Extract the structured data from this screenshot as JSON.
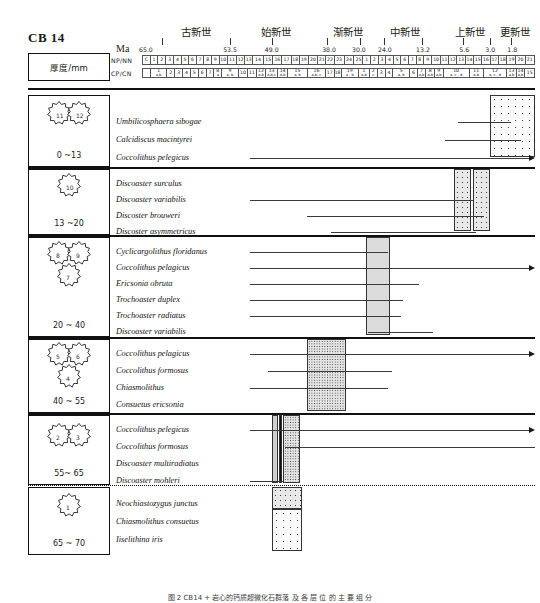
{
  "figure": {
    "sample_id": "CB 14",
    "ma_label": "Ma",
    "thickness_header": "厚度/mm",
    "caption": "图 2   CB14 + 岩心的钙质超微化石群落 及 各 层 位 的 主 要 组 分"
  },
  "timescale": {
    "epochs": [
      {
        "name": "古新世",
        "center_pct": 13.8
      },
      {
        "name": "始新世",
        "center_pct": 34.2
      },
      {
        "name": "渐新世",
        "center_pct": 52.3
      },
      {
        "name": "中新世",
        "center_pct": 66.9
      },
      {
        "name": "上新世",
        "center_pct": 83.4
      },
      {
        "name": "更新世",
        "center_pct": 95.0
      }
    ],
    "boundaries": [
      {
        "value": "65.0",
        "pct": 1.0
      },
      {
        "value": "53.5",
        "pct": 22.4
      },
      {
        "value": "49.0",
        "pct": 33.0
      },
      {
        "value": "38.0",
        "pct": 47.6
      },
      {
        "value": "30.0",
        "pct": 55.2
      },
      {
        "value": "24.0",
        "pct": 61.8
      },
      {
        "value": "13.2",
        "pct": 71.5
      },
      {
        "value": "5.6",
        "pct": 82.0
      },
      {
        "value": "3.0",
        "pct": 88.6
      },
      {
        "value": "1.8",
        "pct": 94.2
      }
    ],
    "epoch_ticks_pct": [
      5.0,
      22.5,
      33.0,
      47.0,
      55.5,
      61.5,
      71.3,
      81.8,
      88.5,
      94.0
    ],
    "np_nn_label": "NP/NN",
    "cp_cn_label": "CP/CN",
    "np_nn_cells": [
      {
        "t": "C",
        "w": 1.0
      },
      {
        "t": "1",
        "w": 1.0
      },
      {
        "t": "2",
        "w": 1.1
      },
      {
        "t": "3",
        "w": 1.0
      },
      {
        "t": "4",
        "w": 1.0
      },
      {
        "t": "5",
        "w": 1.0
      },
      {
        "t": "6",
        "w": 1.0
      },
      {
        "t": "7",
        "w": 1.0
      },
      {
        "t": "8",
        "w": 1.0
      },
      {
        "t": "9",
        "w": 1.0
      },
      {
        "t": "10",
        "w": 1.1
      },
      {
        "t": "11",
        "w": 1.2
      },
      {
        "t": "12",
        "w": 1.1
      },
      {
        "t": "13",
        "w": 1.0
      },
      {
        "t": "14",
        "w": 1.5
      },
      {
        "t": "15",
        "w": 1.2
      },
      {
        "t": "16",
        "w": 1.2
      },
      {
        "t": "17",
        "w": 1.2
      },
      {
        "t": "18",
        "w": 1.1
      },
      {
        "t": "19",
        "w": 1.2
      },
      {
        "t": "20",
        "w": 1.2
      },
      {
        "t": "21",
        "w": 1.1
      },
      {
        "t": "22",
        "w": 1.1
      },
      {
        "t": "23",
        "w": 1.3
      },
      {
        "t": "24",
        "w": 1.3
      },
      {
        "t": "25",
        "w": 1.2
      },
      {
        "t": "1",
        "w": 1.0
      },
      {
        "t": "2",
        "w": 1.0
      },
      {
        "t": "3",
        "w": 1.0
      },
      {
        "t": "4",
        "w": 1.0
      },
      {
        "t": "5",
        "w": 1.0
      },
      {
        "t": "6",
        "w": 1.0
      },
      {
        "t": "7",
        "w": 1.0
      },
      {
        "t": "8",
        "w": 1.0
      },
      {
        "t": "9",
        "w": 1.1
      },
      {
        "t": "10",
        "w": 1.1
      },
      {
        "t": "11",
        "w": 1.1
      },
      {
        "t": "12",
        "w": 1.1
      },
      {
        "t": "13",
        "w": 1.1
      },
      {
        "t": "14",
        "w": 1.1
      },
      {
        "t": "15",
        "w": 1.1
      },
      {
        "t": "16",
        "w": 1.1
      },
      {
        "t": "17",
        "w": 1.1
      },
      {
        "t": "18",
        "w": 1.1
      },
      {
        "t": "19",
        "w": 1.2
      },
      {
        "t": "20",
        "w": 1.2
      },
      {
        "t": "21",
        "w": 1.2
      }
    ],
    "cp_cn_cells": [
      {
        "t": "",
        "w": 1.0
      },
      {
        "t": "1",
        "sub": "a,b",
        "w": 2.1
      },
      {
        "t": "2",
        "w": 1.0
      },
      {
        "t": "3",
        "w": 1.0
      },
      {
        "t": "4",
        "w": 1.0
      },
      {
        "t": "5",
        "w": 1.0
      },
      {
        "t": "6",
        "w": 1.0
      },
      {
        "t": "7",
        "w": 1.0
      },
      {
        "t": "8",
        "sub": "a",
        "w": 1.0
      },
      {
        "t": "9",
        "sub": "a, b",
        "w": 2.1
      },
      {
        "t": "10",
        "w": 1.2
      },
      {
        "t": "11",
        "w": 1.1
      },
      {
        "t": "12",
        "sub": "a,b",
        "w": 1.2
      },
      {
        "t": "13",
        "sub": "a,b,c",
        "w": 1.5
      },
      {
        "t": "14",
        "sub": "a,b",
        "w": 1.3
      },
      {
        "t": "15",
        "sub": "a,   b",
        "w": 2.5
      },
      {
        "t": "16",
        "sub": "a,b, c",
        "w": 2.3
      },
      {
        "t": "17",
        "w": 1.1
      },
      {
        "t": "18",
        "w": 0.9
      },
      {
        "t": "19",
        "sub": "a , b",
        "w": 2.2
      },
      {
        "t": "1",
        "sub": "a,b",
        "w": 1.4
      },
      {
        "t": "2",
        "sub": "c",
        "w": 1.0
      },
      {
        "t": "3",
        "w": 1.0
      },
      {
        "t": "4",
        "w": 1.0
      },
      {
        "t": "5",
        "sub": "a, b",
        "w": 2.1
      },
      {
        "t": "6",
        "w": 1.0
      },
      {
        "t": "7",
        "sub": "a,b",
        "w": 1.1
      },
      {
        "t": "8",
        "sub": "a,b",
        "w": 1.1
      },
      {
        "t": "9",
        "sub": "a,b",
        "w": 1.1
      },
      {
        "t": "10",
        "sub": "a, c ,  d",
        "w": 3.3
      },
      {
        "t": "11",
        "sub": "a,b",
        "w": 1.8
      },
      {
        "t": "12",
        "sub": "a, c , d",
        "w": 3.0
      },
      {
        "t": "13",
        "sub": "a,b",
        "w": 1.2
      },
      {
        "t": "14",
        "sub": "a,b",
        "w": 1.1
      },
      {
        "t": "15",
        "w": 1.2
      }
    ]
  },
  "blocks": [
    {
      "id": "block-1",
      "thickness": "0 ~13",
      "stars": [
        {
          "n": "11"
        },
        {
          "n": "12"
        }
      ],
      "species": [
        {
          "name": "Umbilicosphaera sibogae",
          "start_pct": 80.5,
          "end_pct": 94.0,
          "arrow": false
        },
        {
          "name": "Calcidiscus macintyrei",
          "start_pct": 77.0,
          "end_pct": 96.5,
          "arrow": false
        },
        {
          "name": "Coccolithus pelegicus",
          "start_pct": 27.5,
          "end_pct": 100.0,
          "arrow": true
        }
      ],
      "patterns": [
        {
          "style": "pat-dotlight",
          "left_pct": 88.5,
          "width_pct": 11.5,
          "top": 0,
          "height": 62
        }
      ],
      "separator": "thick"
    },
    {
      "id": "block-2",
      "thickness": "13 ~20",
      "stars": [
        {
          "n": "10"
        }
      ],
      "species": [
        {
          "name": "Discoaster surculus",
          "start_pct": 0,
          "end_pct": 0,
          "arrow": false
        },
        {
          "name": "Discoaster variabilis",
          "start_pct": 27.5,
          "end_pct": 84.5,
          "arrow": false
        },
        {
          "name": "Discoster brouweri",
          "start_pct": 42.0,
          "end_pct": 87.0,
          "arrow": false
        },
        {
          "name": "Discoster asymmetricus",
          "start_pct": 48.0,
          "end_pct": 85.0,
          "arrow": false
        }
      ],
      "patterns": [
        {
          "style": "pat-dotmed",
          "left_pct": 79.5,
          "width_pct": 4.2,
          "top": 0,
          "height": 62
        },
        {
          "style": "pat-dotmed",
          "left_pct": 84.3,
          "width_pct": 4.2,
          "top": 0,
          "height": 62
        }
      ],
      "separator": "thick"
    },
    {
      "id": "block-3",
      "thickness": "20 ~ 40",
      "stars": [
        {
          "n": "8"
        },
        {
          "n": "9"
        },
        {
          "n": "7"
        }
      ],
      "species": [
        {
          "name": "Cyclicargolithus floridanus",
          "start_pct": 27.5,
          "end_pct": 62.5,
          "arrow": false
        },
        {
          "name": "Coccolithus pelagicus",
          "start_pct": 27.5,
          "end_pct": 100.0,
          "arrow": true
        },
        {
          "name": "Ericsonia obruta",
          "start_pct": 27.5,
          "end_pct": 70.5,
          "arrow": false
        },
        {
          "name": "Trochoaster duplex",
          "start_pct": 27.5,
          "end_pct": 66.5,
          "arrow": false
        },
        {
          "name": "Trochoaster radiatus",
          "start_pct": 27.5,
          "end_pct": 66.0,
          "arrow": false
        },
        {
          "name": "Discoaster variabilis",
          "start_pct": 57.5,
          "end_pct": 74.0,
          "arrow": false
        }
      ],
      "patterns": [
        {
          "style": "pat-dotdense",
          "left_pct": 57.0,
          "width_pct": 6.0,
          "top": 0,
          "height": 98
        }
      ],
      "separator": "thick"
    },
    {
      "id": "block-4",
      "thickness": "40 ~ 55",
      "stars": [
        {
          "n": "5"
        },
        {
          "n": "6"
        },
        {
          "n": "4"
        }
      ],
      "species": [
        {
          "name": "Coccolithus pelagicus",
          "start_pct": 27.5,
          "end_pct": 100.0,
          "arrow": true
        },
        {
          "name": "Coccolithus formosus",
          "start_pct": 32.0,
          "end_pct": 63.5,
          "arrow": false
        },
        {
          "name": "Chiasmolithus",
          "start_pct": 27.5,
          "end_pct": 62.5,
          "arrow": false
        },
        {
          "name": "Consuetus ericsonia",
          "start_pct": 0,
          "end_pct": 0,
          "arrow": false
        }
      ],
      "patterns": [
        {
          "style": "pat-dotfine",
          "left_pct": 42.0,
          "width_pct": 10.0,
          "top": 0,
          "height": 72
        }
      ],
      "separator": "thick"
    },
    {
      "id": "block-5",
      "thickness": "55~ 65",
      "stars": [
        {
          "n": "2"
        },
        {
          "n": "3"
        }
      ],
      "species": [
        {
          "name": "Coccolithus pelegicus",
          "start_pct": 27.5,
          "end_pct": 100.0,
          "arrow": true
        },
        {
          "name": "Coccolithus formosus",
          "start_pct": 36.5,
          "end_pct": 100.0,
          "arrow": false
        },
        {
          "name": "Discoaster multiradiatus",
          "start_pct": 0,
          "end_pct": 0,
          "arrow": false
        },
        {
          "name": "Discoaster mohleri",
          "start_pct": 27.5,
          "end_pct": 36.0,
          "arrow": false
        }
      ],
      "patterns": [
        {
          "style": "pat-grey",
          "left_pct": 33.0,
          "width_pct": 1.6,
          "top": 0,
          "height": 68
        },
        {
          "style": "pat-solid",
          "left_pct": 34.8,
          "width_pct": 0.9,
          "top": 0,
          "height": 68
        },
        {
          "style": "pat-dotfine",
          "left_pct": 35.9,
          "width_pct": 4.2,
          "top": 0,
          "height": 68
        }
      ],
      "separator": "dotted"
    },
    {
      "id": "block-6",
      "thickness": "65 ~ 70",
      "stars": [
        {
          "n": "1"
        }
      ],
      "species": [
        {
          "name": "Neochiastozygus     junctus",
          "start_pct": 0,
          "end_pct": 0,
          "arrow": false
        },
        {
          "name": "Chiasmolithus consuetus",
          "start_pct": 0,
          "end_pct": 0,
          "arrow": false
        },
        {
          "name": "Iiselithina iris",
          "start_pct": 0,
          "end_pct": 0,
          "arrow": false
        }
      ],
      "patterns": [
        {
          "style": "pat-dotmed",
          "left_pct": 33.0,
          "width_pct": 7.8,
          "top": 0,
          "height": 22
        },
        {
          "style": "pat-dotlight",
          "left_pct": 33.0,
          "width_pct": 7.8,
          "top": 22,
          "height": 42
        }
      ],
      "separator": "none"
    }
  ],
  "colors": {
    "ink": "#111111",
    "rule": "#3a3a3a",
    "pattern_fill": "#e6e6e6"
  }
}
